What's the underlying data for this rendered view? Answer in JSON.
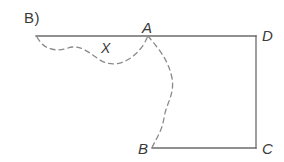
{
  "figure": {
    "panel_label": "B)",
    "background_color": "#ffffff",
    "solid_line_color": "#6b6b6b",
    "dashed_line_color": "#8a8a8a",
    "label_color": "#3a3a3a",
    "width": 284,
    "height": 162,
    "vertices": [
      {
        "name": "A",
        "label": "A",
        "x": 148,
        "y": 36,
        "label_x": 142,
        "label_y": 20
      },
      {
        "name": "D",
        "label": "D",
        "x": 256,
        "y": 36,
        "label_x": 262,
        "label_y": 28
      },
      {
        "name": "C",
        "label": "C",
        "x": 256,
        "y": 148,
        "label_x": 262,
        "label_y": 141
      },
      {
        "name": "B",
        "label": "B",
        "x": 152,
        "y": 148,
        "label_x": 138,
        "label_y": 141
      }
    ],
    "region_label": {
      "text": "X",
      "x": 101,
      "y": 41
    },
    "solid_segments": [
      {
        "name": "top-edge",
        "x1": 36,
        "y1": 36,
        "x2": 256,
        "y2": 36
      },
      {
        "name": "right-edge",
        "x1": 256,
        "y1": 36,
        "x2": 256,
        "y2": 148
      },
      {
        "name": "bottom-edge",
        "x1": 256,
        "y1": 148,
        "x2": 152,
        "y2": 148
      }
    ],
    "dashed_curves": [
      {
        "name": "upper-loop-curve",
        "path": "M 37 37 C 44 50, 56 52, 68 48 C 80 44, 88 52, 100 60 C 114 69, 132 62, 144 44 C 146 40, 147 38, 148 36"
      },
      {
        "name": "lower-boundary-curve",
        "path": "M 148 36 C 156 46, 168 58, 172 78 C 175 94, 166 104, 164 118 C 162 132, 154 142, 152 148"
      }
    ],
    "dash_pattern": "5 4",
    "stroke_width": 1.3
  }
}
